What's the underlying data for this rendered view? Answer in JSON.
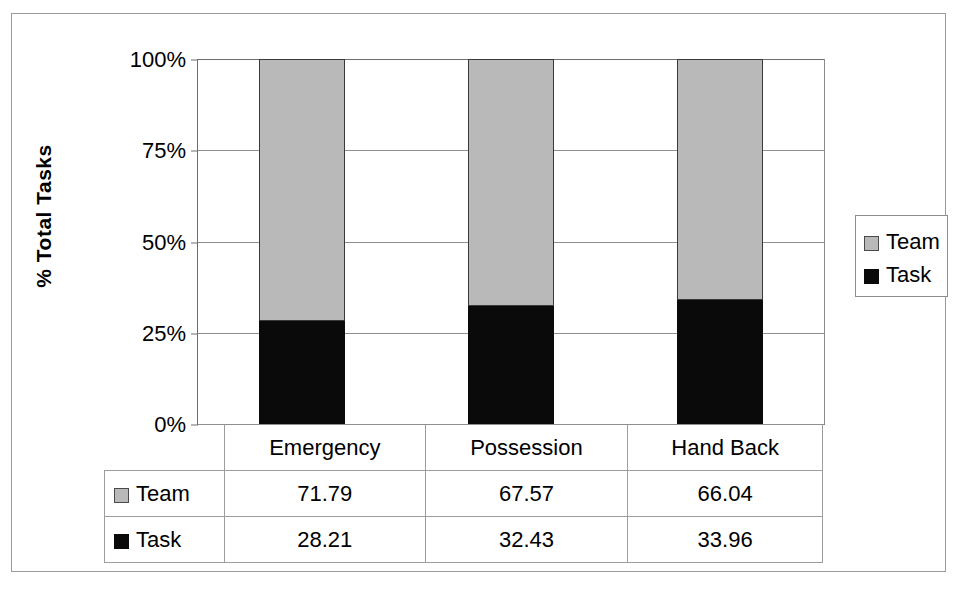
{
  "chart_data": {
    "type": "bar",
    "subtype": "100% stacked column",
    "title": "",
    "xlabel": "",
    "ylabel": "% Total Tasks",
    "categories": [
      "Emergency",
      "Possession",
      "Hand Back"
    ],
    "series": [
      {
        "name": "Team",
        "values": [
          71.79,
          67.57,
          66.04
        ],
        "color": "#b9b9b9"
      },
      {
        "name": "Task",
        "values": [
          28.21,
          32.43,
          33.96
        ],
        "color": "#0a0a0a"
      }
    ],
    "ylim": [
      0,
      100
    ],
    "ytick_labels": [
      "100%",
      "75%",
      "50%",
      "25%",
      "0%"
    ],
    "ytick_values": [
      100,
      75,
      50,
      25,
      0
    ],
    "grid": true,
    "legend_position": "right",
    "data_table_visible": true,
    "stack_order_bottom_to_top": [
      "Task",
      "Team"
    ]
  },
  "axis": {
    "y_title": "% Total Tasks",
    "ticks": [
      {
        "label": "100%",
        "value": 100
      },
      {
        "label": "75%",
        "value": 75
      },
      {
        "label": "50%",
        "value": 50
      },
      {
        "label": "25%",
        "value": 25
      },
      {
        "label": "0%",
        "value": 0
      }
    ]
  },
  "legend": {
    "entries": [
      {
        "label": "Team",
        "swatch": "team-swatch-icon"
      },
      {
        "label": "Task",
        "swatch": "task-swatch-icon"
      }
    ]
  },
  "table": {
    "columns": [
      "Emergency",
      "Possession",
      "Hand Back"
    ],
    "rows": [
      {
        "label": "Team",
        "swatch": "team-swatch-icon",
        "cells": [
          "71.79",
          "67.57",
          "66.04"
        ]
      },
      {
        "label": "Task",
        "swatch": "task-swatch-icon",
        "cells": [
          "28.21",
          "32.43",
          "33.96"
        ]
      }
    ]
  }
}
